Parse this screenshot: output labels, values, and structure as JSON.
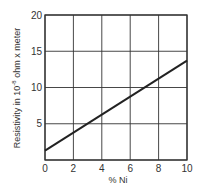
{
  "chart_data": {
    "type": "line",
    "title": "",
    "xlabel": "% Ni",
    "ylabel": "Resistivity in 10^-8 ohm x meter",
    "ylabel_parts": {
      "prefix": "Resistivity in 10",
      "exp": "-8",
      "suffix": " ohm x meter"
    },
    "xlim": [
      0,
      10
    ],
    "ylim": [
      0,
      20
    ],
    "x_ticks": [
      0,
      2,
      4,
      6,
      8,
      10
    ],
    "y_ticks": [
      0,
      5,
      10,
      15,
      20
    ],
    "x_tick_labels": [
      "0",
      "2",
      "4",
      "6",
      "8",
      "10"
    ],
    "y_tick_labels": [
      "0",
      "5",
      "10",
      "15",
      "20"
    ],
    "grid": true,
    "legend": null,
    "series": [
      {
        "name": "Resistivity",
        "x": [
          0,
          10
        ],
        "y": [
          1.3,
          13.7
        ],
        "color": "#222222"
      }
    ]
  },
  "style": {
    "line_color": "#222222",
    "grid_color": "#333333",
    "background": "#ffffff"
  }
}
